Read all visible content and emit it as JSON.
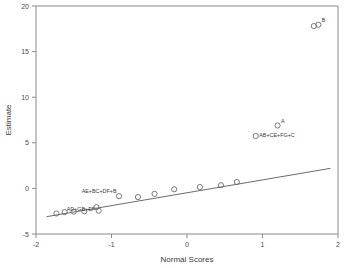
{
  "chart_data": {
    "type": "scatter",
    "title": "",
    "xlabel": "Normal Scores",
    "ylabel": "Estimate",
    "xlim": [
      -2,
      2
    ],
    "ylim": [
      -5,
      20
    ],
    "xticks": [
      "-2",
      "-1",
      "0",
      "1",
      "2"
    ],
    "xtick_values": [
      -2,
      -1,
      0,
      1,
      2
    ],
    "yticks": [
      "-5",
      "0",
      "5",
      "10",
      "15",
      "20"
    ],
    "ytick_values": [
      -5,
      0,
      5,
      10,
      15,
      20
    ],
    "grid": false,
    "legend": "none",
    "points": [
      {
        "x": -1.73,
        "y": -2.75,
        "label": ""
      },
      {
        "x": -1.62,
        "y": -2.6,
        "label": "AD+GB+EF"
      },
      {
        "x": -1.5,
        "y": -2.55,
        "label": ""
      },
      {
        "x": -1.36,
        "y": -2.5,
        "label": ""
      },
      {
        "x": -1.2,
        "y": -2.05,
        "label": ""
      },
      {
        "x": -1.17,
        "y": -2.45,
        "label": ""
      },
      {
        "x": -0.9,
        "y": -0.85,
        "label": "AE+BC+DF+B"
      },
      {
        "x": -0.65,
        "y": -0.95,
        "label": ""
      },
      {
        "x": -0.43,
        "y": -0.6,
        "label": ""
      },
      {
        "x": -0.17,
        "y": -0.1,
        "label": ""
      },
      {
        "x": 0.17,
        "y": 0.15,
        "label": ""
      },
      {
        "x": 0.45,
        "y": 0.35,
        "label": ""
      },
      {
        "x": 0.66,
        "y": 0.7,
        "label": ""
      },
      {
        "x": 0.91,
        "y": 5.75,
        "label": "AB+CE+FG+C"
      },
      {
        "x": 1.2,
        "y": 6.9,
        "label": "A"
      },
      {
        "x": 1.68,
        "y": 17.8,
        "label": ""
      },
      {
        "x": 1.74,
        "y": 17.95,
        "label": "B"
      }
    ],
    "fit_line": {
      "x0": -1.86,
      "y0": -3.1,
      "x1": 1.9,
      "y1": 2.2
    }
  }
}
